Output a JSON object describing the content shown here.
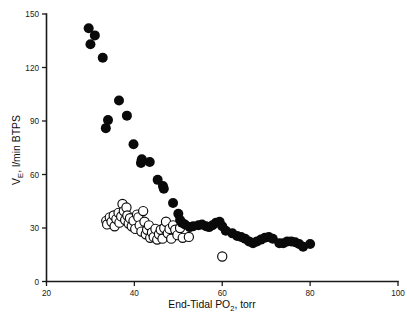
{
  "chart_data": {
    "type": "scatter",
    "title": "",
    "subtitle": "",
    "xlabel": "End-Tidal PO2, torr",
    "xlabel_main": "End-Tidal PO",
    "xlabel_sub": "2",
    "xlabel_tail": ", torr",
    "ylabel": "VE, l/min BTPS",
    "ylabel_main": "V",
    "ylabel_sub": "E",
    "ylabel_tail": ", l/min BTPS",
    "xlim": [
      20,
      100
    ],
    "ylim": [
      0,
      150
    ],
    "xticks": [
      20,
      40,
      60,
      80,
      100
    ],
    "xtick_labels": [
      "20",
      "40",
      "60",
      "80",
      "100"
    ],
    "yticks": [
      0,
      30,
      60,
      90,
      120,
      150
    ],
    "ytick_labels": [
      "0",
      "30",
      "60",
      "90",
      "120",
      "150"
    ],
    "grid": false,
    "legend_position": "none",
    "axis_color": "#1a1a1a",
    "series": [
      {
        "name": "filled-circles",
        "marker": "filled-circle",
        "color": "#0a0a0a",
        "marker_size": 5.0,
        "points": [
          [
            29.6,
            142.0
          ],
          [
            31.0,
            138.0
          ],
          [
            30.0,
            133.0
          ],
          [
            32.8,
            125.5
          ],
          [
            36.5,
            101.5
          ],
          [
            34.0,
            90.5
          ],
          [
            38.3,
            93.0
          ],
          [
            33.5,
            86.0
          ],
          [
            39.8,
            77.0
          ],
          [
            41.5,
            66.5
          ],
          [
            41.7,
            68.5
          ],
          [
            43.5,
            67.0
          ],
          [
            45.3,
            57.0
          ],
          [
            46.5,
            53.5
          ],
          [
            46.7,
            52.0
          ],
          [
            48.8,
            44.0
          ],
          [
            50.0,
            38.0
          ],
          [
            50.4,
            34.5
          ],
          [
            50.8,
            33.0
          ],
          [
            51.5,
            32.0
          ],
          [
            52.6,
            30.5
          ],
          [
            53.4,
            31.0
          ],
          [
            54.6,
            31.5
          ],
          [
            55.4,
            32.0
          ],
          [
            56.3,
            31.0
          ],
          [
            57.0,
            30.5
          ],
          [
            57.8,
            31.5
          ],
          [
            58.6,
            33.0
          ],
          [
            59.4,
            33.5
          ],
          [
            60.0,
            31.0
          ],
          [
            60.8,
            28.5
          ],
          [
            62.3,
            27.0
          ],
          [
            63.4,
            25.5
          ],
          [
            64.3,
            25.0
          ],
          [
            65.2,
            24.0
          ],
          [
            66.1,
            22.5
          ],
          [
            67.0,
            21.5
          ],
          [
            67.9,
            22.5
          ],
          [
            68.8,
            23.5
          ],
          [
            69.7,
            24.5
          ],
          [
            70.6,
            25.0
          ],
          [
            71.5,
            24.0
          ],
          [
            73.0,
            21.5
          ],
          [
            73.9,
            21.5
          ],
          [
            74.8,
            22.5
          ],
          [
            75.7,
            22.5
          ],
          [
            76.6,
            22.0
          ],
          [
            77.5,
            21.0
          ],
          [
            78.4,
            19.5
          ],
          [
            80.0,
            21.0
          ]
        ]
      },
      {
        "name": "open-circles",
        "marker": "open-circle",
        "color": "#0a0a0a",
        "marker_size": 4.6,
        "points": [
          [
            33.6,
            34.0
          ],
          [
            33.8,
            32.0
          ],
          [
            34.4,
            36.0
          ],
          [
            34.8,
            33.5
          ],
          [
            35.3,
            37.0
          ],
          [
            35.5,
            31.0
          ],
          [
            35.9,
            35.0
          ],
          [
            36.4,
            38.5
          ],
          [
            36.6,
            33.0
          ],
          [
            37.0,
            36.5
          ],
          [
            37.3,
            43.5
          ],
          [
            37.6,
            39.5
          ],
          [
            37.9,
            34.5
          ],
          [
            38.2,
            41.5
          ],
          [
            38.4,
            37.0
          ],
          [
            38.7,
            32.5
          ],
          [
            39.0,
            35.5
          ],
          [
            39.4,
            31.0
          ],
          [
            39.8,
            34.0
          ],
          [
            40.2,
            29.5
          ],
          [
            40.6,
            37.5
          ],
          [
            40.9,
            36.0
          ],
          [
            41.2,
            31.5
          ],
          [
            41.6,
            28.0
          ],
          [
            42.0,
            39.5
          ],
          [
            42.3,
            33.5
          ],
          [
            42.6,
            26.5
          ],
          [
            42.9,
            29.0
          ],
          [
            43.3,
            31.5
          ],
          [
            43.6,
            24.5
          ],
          [
            44.0,
            27.5
          ],
          [
            44.4,
            25.0
          ],
          [
            44.8,
            29.5
          ],
          [
            45.2,
            23.5
          ],
          [
            45.6,
            26.5
          ],
          [
            46.0,
            29.0
          ],
          [
            46.4,
            24.0
          ],
          [
            46.8,
            30.0
          ],
          [
            47.2,
            33.5
          ],
          [
            47.6,
            27.0
          ],
          [
            48.0,
            29.5
          ],
          [
            48.4,
            24.0
          ],
          [
            48.8,
            31.5
          ],
          [
            49.3,
            29.0
          ],
          [
            49.8,
            26.0
          ],
          [
            50.4,
            30.0
          ],
          [
            51.0,
            24.5
          ],
          [
            52.4,
            25.0
          ],
          [
            60.0,
            14.0
          ]
        ]
      }
    ]
  }
}
